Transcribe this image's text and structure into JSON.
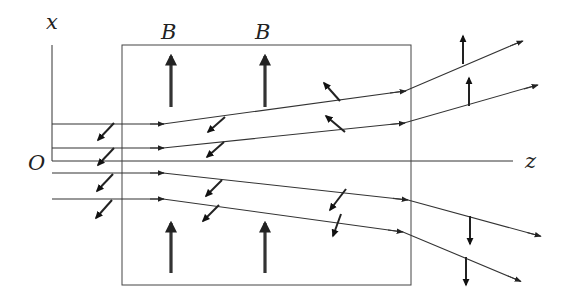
{
  "diagram": {
    "colors": {
      "line": "#333333",
      "background": "#ffffff"
    },
    "labels": {
      "x_axis": "x",
      "z_axis": "z",
      "origin": "O",
      "field_1": "B",
      "field_2": "B"
    },
    "axes": {
      "x_axis": {
        "x": 52,
        "y_top": 45,
        "y_bottom": 161,
        "label_pos": [
          47,
          27
        ]
      },
      "z_axis": {
        "y": 161,
        "x_start": 52,
        "x_end": 513,
        "label_pos": [
          526,
          167
        ]
      },
      "origin_label_pos": [
        30,
        168
      ]
    },
    "field_region": {
      "x": 122,
      "y": 45,
      "width": 289,
      "height": 240
    },
    "field_arrows": [
      {
        "x": 171,
        "y1": 107,
        "y2": 55,
        "label": "B",
        "label_pos": [
          160,
          38
        ]
      },
      {
        "x": 265,
        "y1": 107,
        "y2": 55,
        "label": "B",
        "label_pos": [
          255,
          38
        ]
      },
      {
        "x": 171,
        "y1": 272,
        "y2": 222
      },
      {
        "x": 265,
        "y1": 272,
        "y2": 222
      }
    ],
    "trajectories": [
      {
        "points": [
          [
            52,
            124
          ],
          [
            163,
            124
          ],
          [
            405,
            91
          ],
          [
            522,
            41
          ]
        ],
        "mid_arrows": [
          [
            163,
            124
          ],
          [
            405,
            91
          ]
        ],
        "end_arrow": [
          522,
          41
        ]
      },
      {
        "points": [
          [
            52,
            148
          ],
          [
            163,
            148
          ],
          [
            404,
            123
          ],
          [
            537,
            85
          ]
        ],
        "mid_arrows": [
          [
            163,
            148
          ],
          [
            404,
            123
          ]
        ],
        "end_arrow": [
          537,
          85
        ]
      },
      {
        "points": [
          [
            52,
            173
          ],
          [
            163,
            173
          ],
          [
            408,
            200
          ],
          [
            540,
            236
          ]
        ],
        "mid_arrows": [
          [
            163,
            173
          ],
          [
            408,
            200
          ]
        ],
        "end_arrow": [
          540,
          236
        ]
      },
      {
        "points": [
          [
            52,
            199
          ],
          [
            163,
            199
          ],
          [
            403,
            232
          ],
          [
            520,
            281
          ]
        ],
        "mid_arrows": [
          [
            163,
            199
          ],
          [
            403,
            232
          ]
        ],
        "end_arrow": [
          520,
          281
        ]
      }
    ],
    "force_arrows": [
      {
        "from": [
          114,
          123
        ],
        "to": [
          98,
          140
        ]
      },
      {
        "from": [
          114,
          148
        ],
        "to": [
          98,
          165
        ]
      },
      {
        "from": [
          113,
          174
        ],
        "to": [
          97,
          191
        ]
      },
      {
        "from": [
          112,
          200
        ],
        "to": [
          96,
          218
        ]
      },
      {
        "from": [
          225,
          117
        ],
        "to": [
          208,
          132
        ]
      },
      {
        "from": [
          224,
          141
        ],
        "to": [
          207,
          156
        ]
      },
      {
        "from": [
          222,
          180
        ],
        "to": [
          206,
          196
        ]
      },
      {
        "from": [
          219,
          205
        ],
        "to": [
          203,
          221
        ]
      },
      {
        "from": [
          340,
          101
        ],
        "to": [
          325,
          84
        ]
      },
      {
        "from": [
          344,
          130
        ],
        "to": [
          327,
          116
        ]
      },
      {
        "from": [
          346,
          189
        ],
        "to": [
          330,
          209
        ]
      },
      {
        "from": [
          341,
          214
        ],
        "to": [
          333,
          235
        ]
      },
      {
        "from": [
          463,
          64
        ],
        "to": [
          463,
          37
        ]
      },
      {
        "from": [
          469,
          106
        ],
        "to": [
          469,
          78
        ]
      },
      {
        "from": [
          470,
          216
        ],
        "to": [
          470,
          244
        ]
      },
      {
        "from": [
          466,
          257
        ],
        "to": [
          466,
          284
        ]
      }
    ]
  }
}
